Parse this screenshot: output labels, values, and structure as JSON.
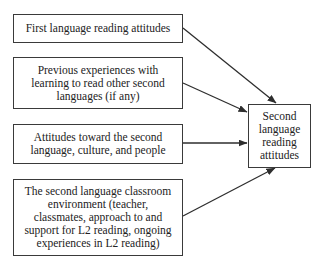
{
  "diagram": {
    "type": "flow",
    "sources": [
      {
        "id": "box-1",
        "label": "First language reading attitudes"
      },
      {
        "id": "box-2",
        "label": "Previous experiences with learning to read other second languages (if any)"
      },
      {
        "id": "box-3",
        "label": "Attitudes toward the second language, culture, and people"
      },
      {
        "id": "box-4",
        "label": "The second language classroom environment (teacher, classmates, approach to and support for L2 reading, ongoing experiences in L2 reading)"
      }
    ],
    "target": {
      "id": "target-box",
      "label": "Second language reading attitudes"
    },
    "edges": [
      {
        "from": "box-1",
        "to": "target-box"
      },
      {
        "from": "box-2",
        "to": "target-box"
      },
      {
        "from": "box-3",
        "to": "target-box"
      },
      {
        "from": "box-4",
        "to": "target-box"
      }
    ],
    "colors": {
      "stroke": "#3a3a3a",
      "text": "#222222",
      "background": "#ffffff"
    }
  }
}
